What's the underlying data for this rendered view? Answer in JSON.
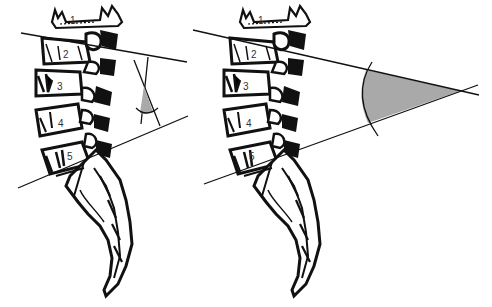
{
  "figure": {
    "colors": {
      "line": "#111111",
      "bone": "#111111",
      "shade": "#a9a9a9",
      "background": "#ffffff"
    },
    "panels": [
      {
        "id": "left",
        "method": "perpendicular-lines",
        "vertebra_labels": [
          "1",
          "2",
          "3",
          "4",
          "5"
        ]
      },
      {
        "id": "right",
        "method": "direct-intersection",
        "vertebra_labels": [
          "1",
          "2",
          "3",
          "4",
          "5"
        ]
      }
    ]
  }
}
